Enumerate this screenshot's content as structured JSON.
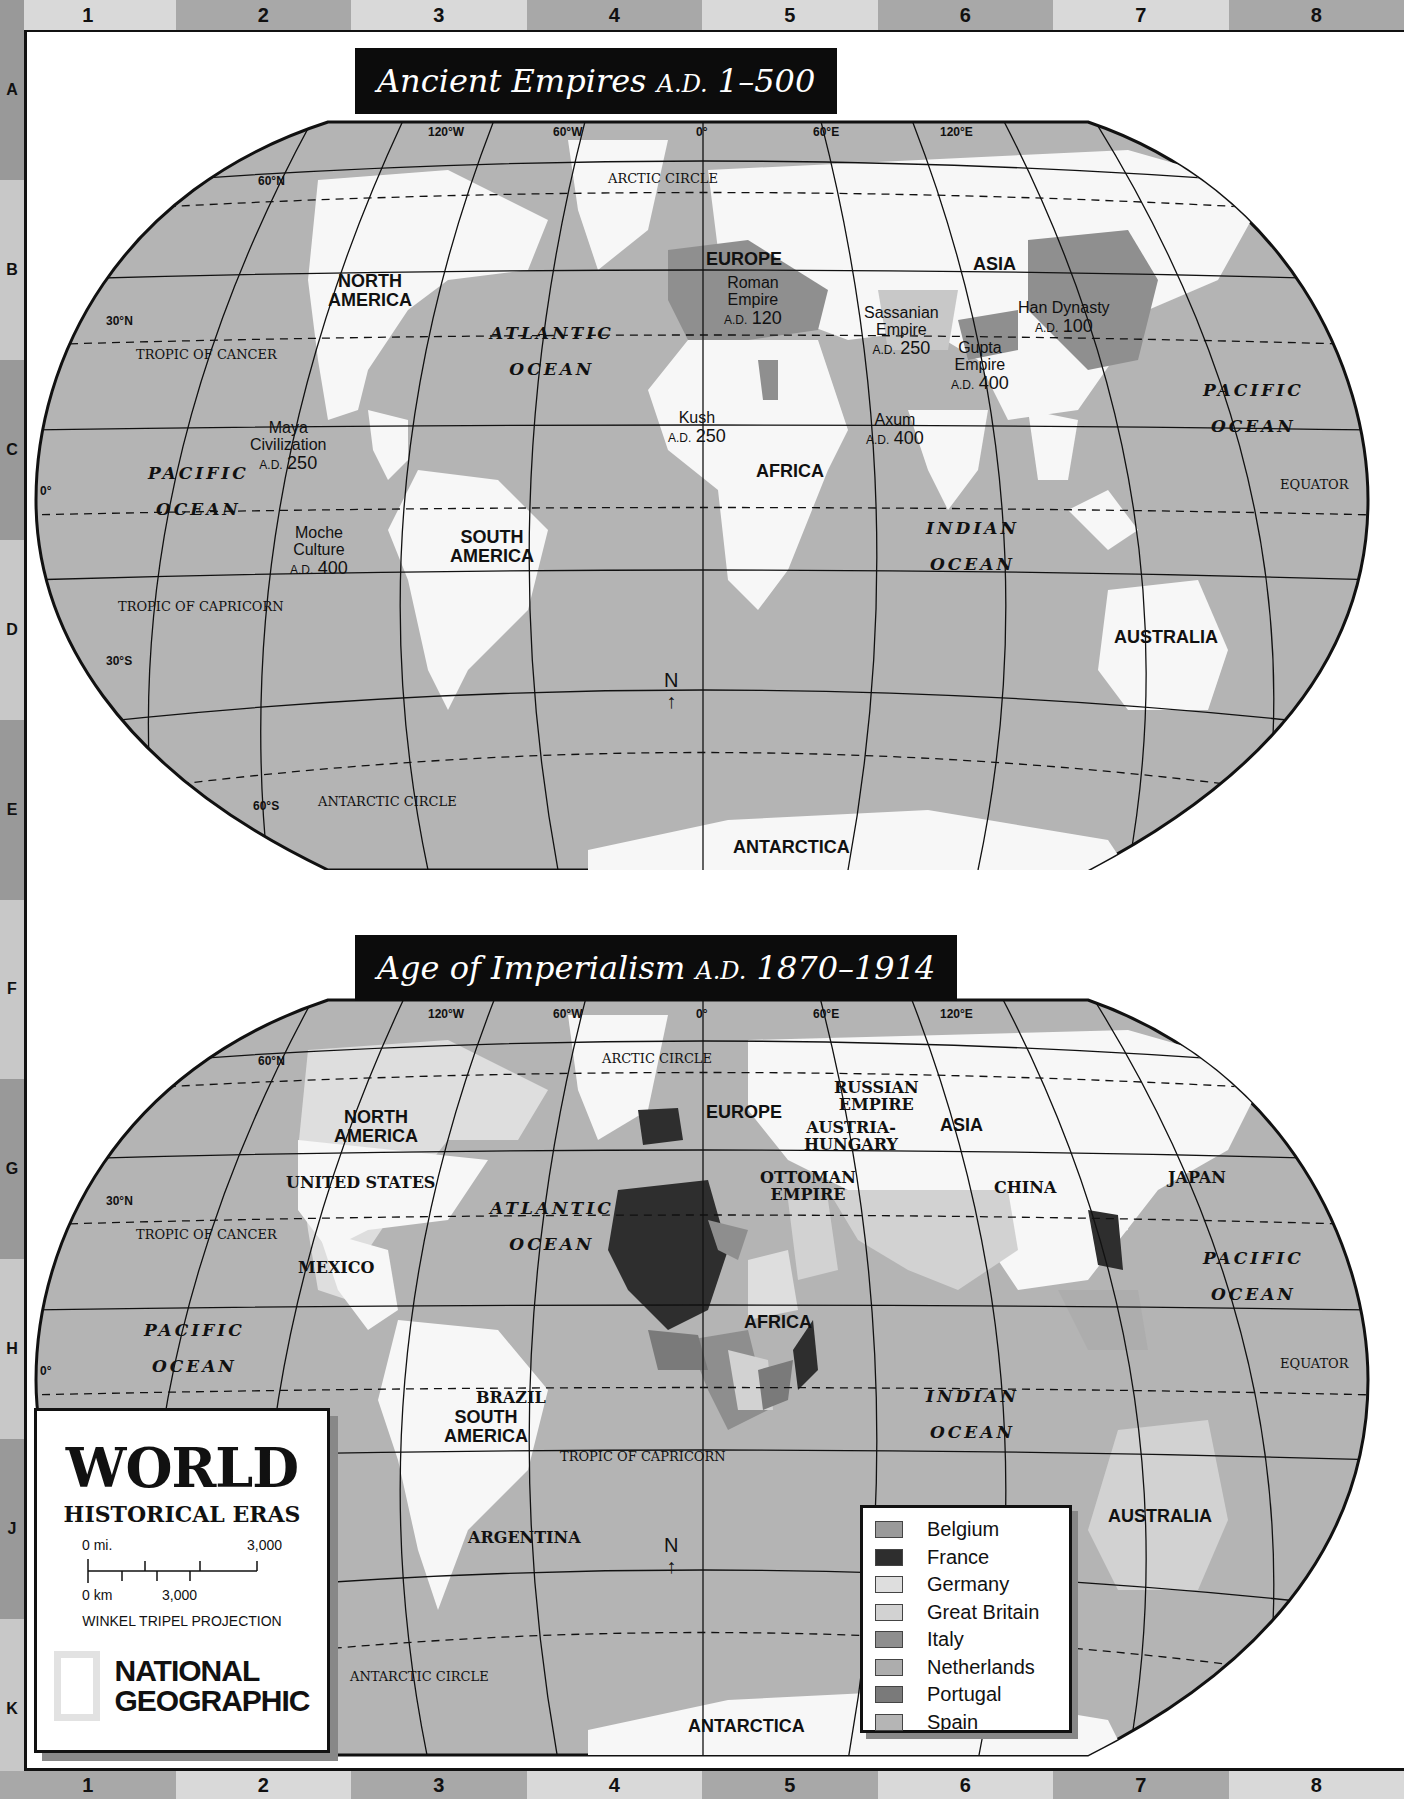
{
  "grid": {
    "columns": [
      "1",
      "2",
      "3",
      "4",
      "5",
      "6",
      "7",
      "8"
    ],
    "rows": [
      "A",
      "B",
      "C",
      "D",
      "E",
      "F",
      "G",
      "H",
      "J",
      "K"
    ]
  },
  "map_top": {
    "title": "Ancient Empires",
    "title_ad": "A.D.",
    "title_range": "1–500",
    "longitudes": [
      "120°W",
      "60°W",
      "0°",
      "60°E",
      "120°E"
    ],
    "latitudes": {
      "n60": "60°N",
      "n30": "30°N",
      "zero": "0°",
      "s30": "30°S",
      "s60": "60°S"
    },
    "lines": {
      "arctic": "ARCTIC CIRCLE",
      "cancer": "TROPIC OF CANCER",
      "equator": "EQUATOR",
      "capricorn": "TROPIC OF CAPRICORN",
      "antarctic": "ANTARCTIC CIRCLE"
    },
    "continents": {
      "north_america_1": "NORTH",
      "north_america_2": "AMERICA",
      "south_america_1": "SOUTH",
      "south_america_2": "AMERICA",
      "europe": "EUROPE",
      "asia": "ASIA",
      "africa": "AFRICA",
      "australia": "AUSTRALIA",
      "antarctica": "ANTARCTICA"
    },
    "oceans": {
      "atlantic_1": "ATLANTIC",
      "atlantic_2": "OCEAN",
      "pacific_1": "PACIFIC",
      "pacific_2": "OCEAN",
      "indian_1": "INDIAN",
      "indian_2": "OCEAN"
    },
    "empires": [
      {
        "name_1": "Roman",
        "name_2": "Empire",
        "ad": "A.D.",
        "year": "120"
      },
      {
        "name_1": "Sassanian",
        "name_2": "Empire",
        "ad": "A.D.",
        "year": "250"
      },
      {
        "name_1": "Gupta",
        "name_2": "Empire",
        "ad": "A.D.",
        "year": "400"
      },
      {
        "name_1": "Han Dynasty",
        "name_2": "",
        "ad": "A.D.",
        "year": "100"
      },
      {
        "name_1": "Kush",
        "name_2": "",
        "ad": "A.D.",
        "year": "250"
      },
      {
        "name_1": "Axum",
        "name_2": "",
        "ad": "A.D.",
        "year": "400"
      },
      {
        "name_1": "Maya",
        "name_2": "Civilization",
        "ad": "A.D.",
        "year": "250"
      },
      {
        "name_1": "Moche",
        "name_2": "Culture",
        "ad": "A.D.",
        "year": "400"
      }
    ],
    "north_arrow": "N"
  },
  "map_bottom": {
    "title": "Age of Imperialism",
    "title_ad": "A.D.",
    "title_range": "1870–1914",
    "longitudes": [
      "120°W",
      "60°W",
      "0°",
      "60°E",
      "120°E"
    ],
    "latitudes": {
      "n60": "60°N",
      "n30": "30°N",
      "zero": "0°"
    },
    "lines": {
      "arctic": "ARCTIC CIRCLE",
      "cancer": "TROPIC OF CANCER",
      "equator": "EQUATOR",
      "capricorn": "TROPIC OF CAPRICORN",
      "antarctic": "ANTARCTIC CIRCLE"
    },
    "continents": {
      "north_america_1": "NORTH",
      "north_america_2": "AMERICA",
      "south_america_1": "SOUTH",
      "south_america_2": "AMERICA",
      "europe": "EUROPE",
      "asia": "ASIA",
      "africa": "AFRICA",
      "australia": "AUSTRALIA",
      "antarctica": "ANTARCTICA"
    },
    "oceans": {
      "atlantic_1": "ATLANTIC",
      "atlantic_2": "OCEAN",
      "pacific_w_1": "PACIFIC",
      "pacific_w_2": "OCEAN",
      "pacific_e_1": "PACIFIC",
      "pacific_e_2": "OCEAN",
      "indian_1": "INDIAN",
      "indian_2": "OCEAN"
    },
    "countries": {
      "usa": "UNITED STATES",
      "mexico": "MEXICO",
      "brazil": "BRAZIL",
      "argentina": "ARGENTINA",
      "russia_1": "RUSSIAN",
      "russia_2": "EMPIRE",
      "austria_1": "AUSTRIA-",
      "austria_2": "HUNGARY",
      "ottoman_1": "OTTOMAN",
      "ottoman_2": "EMPIRE",
      "china": "CHINA",
      "japan": "JAPAN"
    },
    "north_arrow": "N"
  },
  "title_box": {
    "title": "WORLD",
    "subtitle": "HISTORICAL ERAS",
    "scale_mi_0": "0 mi.",
    "scale_mi_max": "3,000",
    "scale_km_0": "0 km",
    "scale_km_max": "3,000",
    "projection": "WINKEL TRIPEL PROJECTION",
    "brand_1": "NATIONAL",
    "brand_2": "GEOGRAPHIC"
  },
  "legend": {
    "items": [
      {
        "label": "Belgium",
        "color": "#9a9a9a"
      },
      {
        "label": "France",
        "color": "#2e2e2e"
      },
      {
        "label": "Germany",
        "color": "#dedede"
      },
      {
        "label": "Great Britain",
        "color": "#d2d2d2"
      },
      {
        "label": "Italy",
        "color": "#8e8e8e"
      },
      {
        "label": "Netherlands",
        "color": "#adadad"
      },
      {
        "label": "Portugal",
        "color": "#7a7a7a"
      },
      {
        "label": "Spain",
        "color": "#b5b5b5"
      }
    ]
  },
  "colors": {
    "ocean": "#b4b4b4",
    "land": "#f7f7f7",
    "banner": "#0c0c0c",
    "empire": "#8f8f8f"
  }
}
